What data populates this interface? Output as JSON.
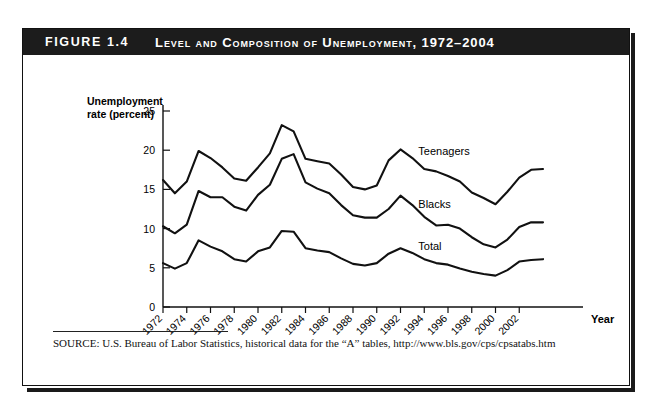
{
  "figure": {
    "number_label": "FIGURE 1.4",
    "title": "Level and Composition of Unemployment, 1972–2004"
  },
  "source": {
    "text": "SOURCE: U.S. Bureau of Labor Statistics, historical data for the “A” tables, http://www.bls.gov/cps/cpsatabs.htm"
  },
  "axes": {
    "y_title_line1": "Unemployment",
    "y_title_line2": "rate (percent)",
    "x_title": "Year",
    "y_ticks": [
      "0",
      "5",
      "10",
      "15",
      "20",
      "25"
    ],
    "x_ticks": [
      "1972",
      "1974",
      "1976",
      "1978",
      "1980",
      "1982",
      "1984",
      "1986",
      "1988",
      "1990",
      "1992",
      "1994",
      "1996",
      "1998",
      "2000",
      "2002"
    ]
  },
  "colors": {
    "line": "#111111",
    "title_bar_bg": "#1c1c1c",
    "title_bar_text": "#ffffff",
    "frame_border": "#111111",
    "page_bg": "#ffffff"
  },
  "chart_data": {
    "type": "line",
    "title": "Level and Composition of Unemployment, 1972–2004",
    "xlabel": "Year",
    "ylabel": "Unemployment rate (percent)",
    "xlim": [
      1972,
      2004
    ],
    "ylim": [
      0,
      25
    ],
    "grid": false,
    "legend": "inline-annotations",
    "x": [
      1972,
      1973,
      1974,
      1975,
      1976,
      1977,
      1978,
      1979,
      1980,
      1981,
      1982,
      1983,
      1984,
      1985,
      1986,
      1987,
      1988,
      1989,
      1990,
      1991,
      1992,
      1993,
      1994,
      1995,
      1996,
      1997,
      1998,
      1999,
      2000,
      2001,
      2002,
      2003,
      2004
    ],
    "series": [
      {
        "name": "Teenagers",
        "label_position": {
          "x": 1993.5,
          "y": 19.4
        },
        "values": [
          16.2,
          14.5,
          16.0,
          19.9,
          19.0,
          17.8,
          16.4,
          16.1,
          17.8,
          19.6,
          23.2,
          22.4,
          18.9,
          18.6,
          18.3,
          16.9,
          15.3,
          15.0,
          15.5,
          18.7,
          20.1,
          19.0,
          17.6,
          17.3,
          16.7,
          16.0,
          14.6,
          13.9,
          13.1,
          14.7,
          16.5,
          17.5,
          17.6
        ]
      },
      {
        "name": "Blacks",
        "label_position": {
          "x": 1993.5,
          "y": 12.6
        },
        "values": [
          10.3,
          9.4,
          10.5,
          14.8,
          14.0,
          14.0,
          12.8,
          12.3,
          14.3,
          15.6,
          18.9,
          19.5,
          15.9,
          15.1,
          14.5,
          13.0,
          11.7,
          11.4,
          11.4,
          12.5,
          14.2,
          13.0,
          11.5,
          10.4,
          10.5,
          10.0,
          8.9,
          8.0,
          7.6,
          8.6,
          10.2,
          10.8,
          10.8
        ]
      },
      {
        "name": "Total",
        "label_position": {
          "x": 1993.5,
          "y": 7.3
        },
        "values": [
          5.6,
          4.9,
          5.6,
          8.5,
          7.7,
          7.1,
          6.1,
          5.8,
          7.1,
          7.6,
          9.7,
          9.6,
          7.5,
          7.2,
          7.0,
          6.2,
          5.5,
          5.3,
          5.6,
          6.8,
          7.5,
          6.9,
          6.1,
          5.6,
          5.4,
          4.9,
          4.5,
          4.2,
          4.0,
          4.7,
          5.8,
          6.0,
          6.1
        ]
      }
    ]
  }
}
